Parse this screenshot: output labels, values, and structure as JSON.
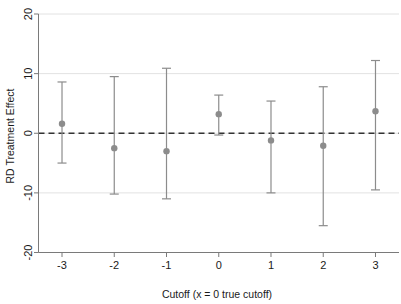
{
  "chart_data": {
    "type": "scatter",
    "title": "",
    "subtitle": "",
    "xlabel": "Cutoff (x = 0 true cutoff)",
    "ylabel": "RD Treatment Effect",
    "x": [
      -3,
      -2,
      -1,
      0,
      1,
      2,
      3
    ],
    "xticklabels": [
      "-3",
      "-2",
      "-1",
      "0",
      "1",
      "2",
      "3"
    ],
    "yticklabels": [
      "20",
      "10",
      "0",
      "-10",
      "-20"
    ],
    "yticks": [
      20,
      10,
      0,
      -10,
      -20
    ],
    "xlim": [
      -3.45,
      3.45
    ],
    "ylim": [
      -20,
      20
    ],
    "grid": "horizontal-gridlines-at-yticks",
    "legend": "none",
    "reference_line": {
      "y": 0,
      "style": "dashed",
      "color": "#333333"
    },
    "series": [
      {
        "name": "RD Treatment Effect",
        "marker": "circle",
        "color": "#8c8c8c",
        "values": [
          1.6,
          -2.5,
          -3.0,
          3.2,
          -1.2,
          -2.1,
          3.7
        ],
        "ci_low": [
          -5.0,
          -10.2,
          -11.0,
          -0.3,
          -10.0,
          -15.5,
          -9.5
        ],
        "ci_high": [
          8.6,
          9.5,
          10.9,
          6.4,
          5.4,
          7.8,
          12.2
        ]
      }
    ]
  },
  "axes": {
    "x_title": "Cutoff (x = 0 true cutoff)",
    "y_title": "RD Treatment Effect"
  }
}
